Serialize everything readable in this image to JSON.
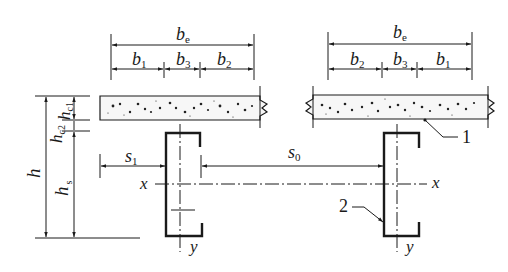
{
  "figure": {
    "left_dimensions": {
      "overall": {
        "main": "b",
        "sub": "e"
      },
      "segments": [
        {
          "main": "b",
          "sub": "1"
        },
        {
          "main": "b",
          "sub": "3"
        },
        {
          "main": "b",
          "sub": "2"
        }
      ]
    },
    "right_dimensions": {
      "overall": {
        "main": "b",
        "sub": "e"
      },
      "segments": [
        {
          "main": "b",
          "sub": "2"
        },
        {
          "main": "b",
          "sub": "3"
        },
        {
          "main": "b",
          "sub": "1"
        }
      ]
    },
    "vertical_dimensions": {
      "total": {
        "main": "h",
        "sub": ""
      },
      "hc1": {
        "main": "h",
        "sub": "c1"
      },
      "hc2": {
        "main": "h",
        "sub": "c2"
      },
      "hs": {
        "main": "h",
        "sub": "s"
      }
    },
    "spacing": {
      "s1": {
        "main": "s",
        "sub": "1"
      },
      "s0": {
        "main": "s",
        "sub": "0"
      }
    },
    "axes": {
      "x_left": "x",
      "x_right": "x",
      "y_left": "y",
      "y_right": "y"
    },
    "callouts": [
      {
        "number": "1",
        "target": "concrete slab"
      },
      {
        "number": "2",
        "target": "cold-formed channel section"
      }
    ]
  }
}
